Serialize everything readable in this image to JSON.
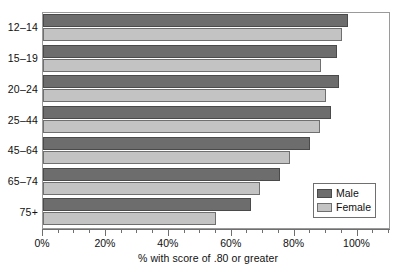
{
  "chart_data": {
    "type": "bar",
    "orientation": "horizontal",
    "title": "",
    "xlabel": "% with score of .80 or greater",
    "ylabel": "",
    "categories": [
      "12–14",
      "15–19",
      "20–24",
      "25–44",
      "45–64",
      "65–74",
      "75+"
    ],
    "series": [
      {
        "name": "Male",
        "color": "#6d6d6d",
        "values": [
          97,
          93.5,
          94,
          91.5,
          85,
          75.5,
          66
        ]
      },
      {
        "name": "Female",
        "color": "#c3c3c3",
        "values": [
          95,
          88.5,
          90,
          88,
          78.5,
          69,
          55
        ]
      }
    ],
    "xlim": [
      0,
      110
    ],
    "xticks": [
      0,
      20,
      40,
      60,
      80,
      100
    ],
    "xtick_labels": [
      "0%",
      "20%",
      "40%",
      "60%",
      "80%",
      "100%"
    ],
    "minor_tick_step": 5,
    "grid": false,
    "legend": {
      "position": "lower-right",
      "entries": [
        {
          "label": "Male",
          "color": "#6d6d6d"
        },
        {
          "label": "Female",
          "color": "#c3c3c3"
        }
      ]
    }
  }
}
